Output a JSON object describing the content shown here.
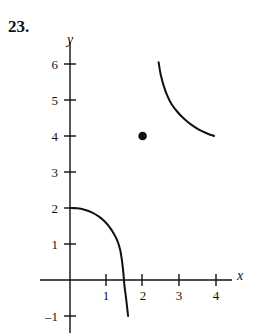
{
  "exercise": {
    "number_label": "23."
  },
  "chart_data": {
    "type": "line",
    "title": "",
    "xlabel": "x",
    "ylabel": "y",
    "grid": false,
    "legend": null,
    "xlim": [
      -0.85,
      4.5
    ],
    "ylim": [
      -1.5,
      6.6
    ],
    "xticks": [
      1,
      2,
      3,
      4
    ],
    "yticks": [
      6,
      5,
      4,
      3,
      2,
      1,
      -1
    ],
    "xtick_labels": [
      "1",
      "2",
      "3",
      "4"
    ],
    "ytick_labels": [
      "6",
      "5",
      "4",
      "3",
      "2",
      "1",
      "–1"
    ],
    "series": [
      {
        "name": "upper-branch",
        "type": "line",
        "style": "solid",
        "points": [
          [
            2.44,
            6.05
          ],
          [
            2.5,
            5.7
          ],
          [
            2.58,
            5.4
          ],
          [
            2.68,
            5.12
          ],
          [
            2.8,
            4.88
          ],
          [
            2.95,
            4.68
          ],
          [
            3.12,
            4.5
          ],
          [
            3.32,
            4.33
          ],
          [
            3.55,
            4.18
          ],
          [
            3.78,
            4.07
          ],
          [
            3.97,
            4.0
          ]
        ]
      },
      {
        "name": "lower-branch",
        "type": "line",
        "style": "solid",
        "points": [
          [
            0.0,
            2.0
          ],
          [
            0.2,
            1.99
          ],
          [
            0.4,
            1.95
          ],
          [
            0.6,
            1.88
          ],
          [
            0.8,
            1.76
          ],
          [
            0.95,
            1.63
          ],
          [
            1.08,
            1.48
          ],
          [
            1.2,
            1.3
          ],
          [
            1.3,
            1.1
          ],
          [
            1.38,
            0.85
          ],
          [
            1.43,
            0.55
          ],
          [
            1.47,
            0.2
          ],
          [
            1.5,
            -0.15
          ],
          [
            1.55,
            -0.55
          ],
          [
            1.6,
            -1.0
          ]
        ]
      }
    ],
    "points": [
      {
        "name": "hole-or-marker",
        "x": 2,
        "y": 4,
        "marker": "filled-circle"
      }
    ],
    "colors": {
      "curve": "#111111",
      "axis": "#111111",
      "background": "#ffffff"
    }
  }
}
